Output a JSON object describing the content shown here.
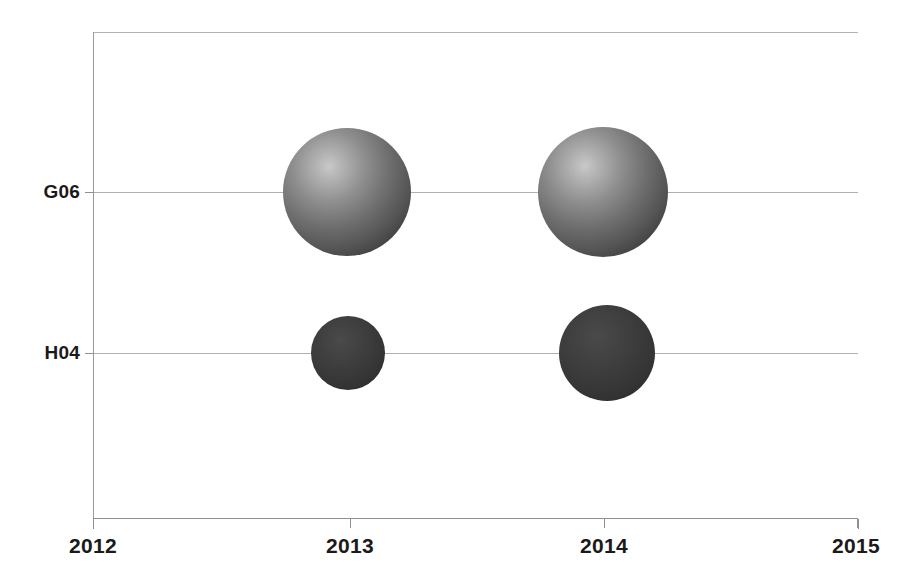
{
  "chart_data": {
    "type": "scatter",
    "title": "",
    "xlabel": "",
    "ylabel": "",
    "x_tick_labels": [
      "2012",
      "2013",
      "2014",
      "2015"
    ],
    "x_tick_values": [
      2012,
      2013,
      2014,
      2015
    ],
    "xlim": [
      2012,
      2015
    ],
    "y_categories": [
      "G06",
      "H04"
    ],
    "ylim_categories": [
      "G06",
      "H04"
    ],
    "grid": true,
    "legend": "none",
    "series": [
      {
        "name": "G06",
        "category": "G06",
        "color": "#7a7a7a",
        "style": "3d-sphere-light",
        "points": [
          {
            "x": 2013,
            "y": "G06",
            "size_px": 128,
            "size_value": 128
          },
          {
            "x": 2014,
            "y": "G06",
            "size_px": 130,
            "size_value": 130
          }
        ]
      },
      {
        "name": "H04",
        "category": "H04",
        "color": "#383838",
        "style": "3d-sphere-dark",
        "points": [
          {
            "x": 2013,
            "y": "H04",
            "size_px": 74,
            "size_value": 74
          },
          {
            "x": 2014,
            "y": "H04",
            "size_px": 96,
            "size_value": 96
          }
        ]
      }
    ]
  },
  "axes": {
    "y_labels": [
      {
        "text": "G06",
        "position_px": 160
      },
      {
        "text": "H04",
        "position_px": 321
      }
    ],
    "x_labels": [
      {
        "text": "2012",
        "position_px": 93
      },
      {
        "text": "2013",
        "position_px": 350
      },
      {
        "text": "2014",
        "position_px": 604
      },
      {
        "text": "2015",
        "position_px": 858
      }
    ]
  },
  "bubbles": [
    {
      "name": "bubble-g06-2013",
      "cx": 347,
      "cy": 192,
      "d": 128,
      "tone": "light"
    },
    {
      "name": "bubble-g06-2014",
      "cx": 603,
      "cy": 192,
      "d": 130,
      "tone": "light"
    },
    {
      "name": "bubble-h04-2013",
      "cx": 348,
      "cy": 353,
      "d": 74,
      "tone": "dark"
    },
    {
      "name": "bubble-h04-2014",
      "cx": 607,
      "cy": 353,
      "d": 96,
      "tone": "dark"
    }
  ],
  "colors": {
    "background": "#ffffff",
    "axis": "#8f8f8f",
    "gridline": "#b0b0b0",
    "label_text": "#1a1a1a",
    "bubble_light": "#8e8e8e",
    "bubble_dark": "#383838"
  }
}
